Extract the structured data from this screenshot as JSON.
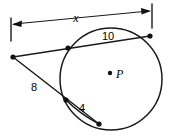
{
  "figure": {
    "type": "circle-secants-geometry-diagram",
    "background_color": "#ffffff",
    "stroke_color": "#1a1a1a",
    "canvas": {
      "width": 170,
      "height": 138
    }
  },
  "labels": {
    "x": "x",
    "ten": "10",
    "eight": "8",
    "four": "4",
    "center": "P"
  },
  "circle": {
    "center_x": 111,
    "center_y": 79,
    "radius": 51,
    "center_dot_x": 110,
    "center_dot_y": 73,
    "center_label_x": 116,
    "center_label_y": 78
  },
  "points": {
    "external_vertex": {
      "x": 13,
      "y": 57
    },
    "upper_secant_near": {
      "x": 68,
      "y": 48
    },
    "upper_secant_far": {
      "x": 150,
      "y": 36
    },
    "lower_secant_near": {
      "x": 66,
      "y": 100
    },
    "lower_secant_far": {
      "x": 99,
      "y": 124
    }
  },
  "dimension_line": {
    "label": "x",
    "label_x": 76,
    "label_y": 22,
    "left_tick_x": 11,
    "left_tick_y1": 18,
    "left_tick_y2": 41,
    "right_tick_x": 152,
    "right_tick_y1": 4,
    "right_tick_y2": 28,
    "arrow_left_x": 14,
    "arrow_left_y": 24,
    "arrow_right_x": 149,
    "arrow_right_y": 12
  },
  "label_positions": {
    "ten_x": 108,
    "ten_y": 40,
    "eight_x": 34,
    "eight_y": 91,
    "four_x": 82,
    "four_y": 112
  }
}
